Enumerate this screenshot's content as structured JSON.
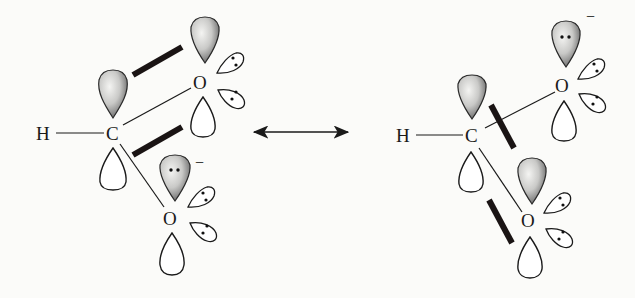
{
  "diagram": {
    "type": "resonance-structures-orbital-picture",
    "resonance_arrow": "double-headed",
    "structures": [
      {
        "id": "left",
        "atoms": {
          "h_label": "H",
          "c_label": "C",
          "o_top_label": "O",
          "o_bottom_label": "O"
        },
        "charge": {
          "symbol": "−",
          "on": "bottom oxygen"
        },
        "pi_overlap": "C–O(top) p orbitals overlapping",
        "lone_pair_lobes_per_oxygen": 2
      },
      {
        "id": "right",
        "atoms": {
          "h_label": "H",
          "c_label": "C",
          "o_top_label": "O",
          "o_bottom_label": "O"
        },
        "charge": {
          "symbol": "−",
          "on": "top oxygen"
        },
        "pi_overlap": "C–O(bottom) p orbitals overlapping",
        "lone_pair_lobes_per_oxygen": 2
      }
    ]
  },
  "colors": {
    "background": "#fbfbf9",
    "ink": "#1a1a1a",
    "overlap_bar": "#1a1414",
    "lobe_shade_light": "#f4f4f2",
    "lobe_shade_dark": "#4a4a4a"
  }
}
